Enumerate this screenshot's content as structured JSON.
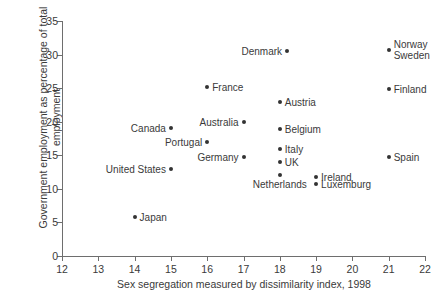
{
  "chart_data": {
    "type": "scatter",
    "title": "",
    "xlabel": "Sex segregation measured by dissimilarity index, 1998",
    "ylabel": "Government employment as percentage of total\nemployment",
    "xlim": [
      12,
      22
    ],
    "ylim": [
      0,
      35
    ],
    "xticks": [
      12,
      13,
      14,
      15,
      16,
      17,
      18,
      19,
      20,
      21,
      22
    ],
    "yticks": [
      0,
      5,
      10,
      15,
      20,
      25,
      30,
      35
    ],
    "grid": false,
    "legend": "none",
    "points": [
      {
        "label": "Japan",
        "x": 14,
        "y": 5.8,
        "label_pos": "right"
      },
      {
        "label": "United States",
        "x": 15,
        "y": 13.0,
        "label_pos": "left"
      },
      {
        "label": "Canada",
        "x": 15,
        "y": 19.0,
        "label_pos": "left"
      },
      {
        "label": "France",
        "x": 16,
        "y": 25.1,
        "label_pos": "right"
      },
      {
        "label": "Portugal",
        "x": 16,
        "y": 17.0,
        "label_pos": "left"
      },
      {
        "label": "Australia",
        "x": 17,
        "y": 19.9,
        "label_pos": "left"
      },
      {
        "label": "Germany",
        "x": 17,
        "y": 14.8,
        "label_pos": "left"
      },
      {
        "label": "Denmark",
        "x": 18.2,
        "y": 30.6,
        "label_pos": "left"
      },
      {
        "label": "Austria",
        "x": 18,
        "y": 22.9,
        "label_pos": "right"
      },
      {
        "label": "Belgium",
        "x": 18,
        "y": 18.9,
        "label_pos": "right"
      },
      {
        "label": "Italy",
        "x": 18,
        "y": 15.9,
        "label_pos": "right"
      },
      {
        "label": "UK",
        "x": 18,
        "y": 14.0,
        "label_pos": "right"
      },
      {
        "label": "Netherlands",
        "x": 18,
        "y": 12.0,
        "label_pos": "below"
      },
      {
        "label": "Ireland",
        "x": 19,
        "y": 11.8,
        "label_pos": "right"
      },
      {
        "label": "Luxemburg",
        "x": 19,
        "y": 10.7,
        "label_pos": "right"
      },
      {
        "label": "Norway\nSweden",
        "x": 21,
        "y": 30.7,
        "label_pos": "right"
      },
      {
        "label": "Finland",
        "x": 21,
        "y": 24.9,
        "label_pos": "right"
      },
      {
        "label": "Spain",
        "x": 21,
        "y": 14.8,
        "label_pos": "right"
      }
    ],
    "colors": {
      "marker": "#333333",
      "axis": "#6e6e6e",
      "text": "#3a3a3a",
      "background": "#ffffff"
    }
  }
}
